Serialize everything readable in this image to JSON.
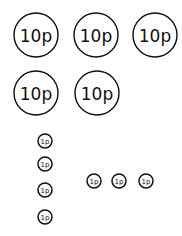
{
  "ten_pence": {
    "label": "10p",
    "count": 5,
    "coins": [
      {
        "cx": 36,
        "cy": 35,
        "r": 22
      },
      {
        "cx": 96,
        "cy": 35,
        "r": 22
      },
      {
        "cx": 155,
        "cy": 35,
        "r": 22
      },
      {
        "cx": 36,
        "cy": 93,
        "r": 22
      },
      {
        "cx": 97,
        "cy": 93,
        "r": 22
      }
    ]
  },
  "one_penny_column": {
    "label": "1p",
    "count": 4,
    "coins": [
      {
        "cx": 45,
        "cy": 141,
        "r": 7
      },
      {
        "cx": 45,
        "cy": 164,
        "r": 7
      },
      {
        "cx": 45,
        "cy": 190,
        "r": 7
      },
      {
        "cx": 45,
        "cy": 217,
        "r": 7
      }
    ]
  },
  "one_penny_row": {
    "label": "1p",
    "count": 3,
    "coins": [
      {
        "cx": 94,
        "cy": 181,
        "r": 7
      },
      {
        "cx": 119,
        "cy": 181,
        "r": 7
      },
      {
        "cx": 146,
        "cy": 181,
        "r": 7
      }
    ]
  },
  "colors": {
    "ink": "#111111",
    "background": "#ffffff"
  }
}
